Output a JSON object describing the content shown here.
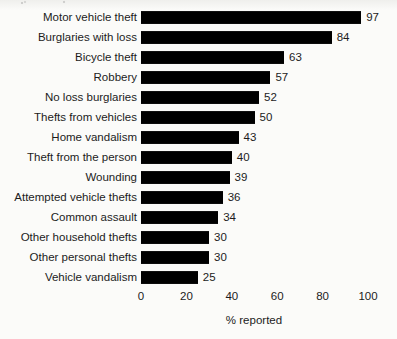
{
  "chart_data": {
    "type": "bar",
    "orientation": "horizontal",
    "title": "",
    "subtitle": "",
    "xlabel": "% reported",
    "ylabel": "",
    "xlim": [
      0,
      100
    ],
    "x_ticks": [
      0,
      20,
      40,
      60,
      80,
      100
    ],
    "x_tick_labels": [
      "0",
      "20",
      "40",
      "60",
      "80",
      "100"
    ],
    "grid": false,
    "legend": null,
    "bar_color": "#000000",
    "background_color": "#fbfbf9",
    "value_labels_shown": true,
    "categories": [
      "Motor vehicle theft",
      "Burglaries with loss",
      "Bicycle theft",
      "Robbery",
      "No loss burglaries",
      "Thefts from vehicles",
      "Home vandalism",
      "Theft from the person",
      "Wounding",
      "Attempted vehicle thefts",
      "Common assault",
      "Other household thefts",
      "Other personal thefts",
      "Vehicle vandalism"
    ],
    "values": [
      97,
      84,
      63,
      57,
      52,
      50,
      43,
      40,
      39,
      36,
      34,
      30,
      30,
      25
    ],
    "value_labels": [
      "97",
      "84",
      "63",
      "57",
      "52",
      "50",
      "43",
      "40",
      "39",
      "36",
      "34",
      "30",
      "30",
      "25"
    ]
  }
}
